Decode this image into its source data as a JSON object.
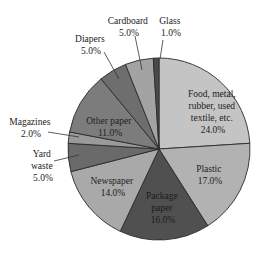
{
  "chart_data": {
    "type": "pie",
    "title": "",
    "start_angle_deg": 0,
    "direction": "clockwise",
    "slices": [
      {
        "label": "Food, metal, rubber, used textile, etc.",
        "value": 24.0,
        "display": "24.0%",
        "color": "#c4c4c4"
      },
      {
        "label": "Plastic",
        "value": 17.0,
        "display": "17.0%",
        "color": "#b2b2b2"
      },
      {
        "label": "Package paper",
        "value": 16.0,
        "display": "16.0%",
        "color": "#505050"
      },
      {
        "label": "Newspaper",
        "value": 14.0,
        "display": "14.0%",
        "color": "#a9a9a9"
      },
      {
        "label": "Yard waste",
        "value": 5.0,
        "display": "5.0%",
        "color": "#6a6a6a"
      },
      {
        "label": "Magazines",
        "value": 2.0,
        "display": "2.0%",
        "color": "#9a9a9a"
      },
      {
        "label": "Other paper",
        "value": 11.0,
        "display": "11.0%",
        "color": "#7c7c7c"
      },
      {
        "label": "Diapers",
        "value": 5.0,
        "display": "5.0%",
        "color": "#6e6e6e"
      },
      {
        "label": "Cardboard",
        "value": 5.0,
        "display": "5.0%",
        "color": "#a3a3a3"
      },
      {
        "label": "Glass",
        "value": 1.0,
        "display": "1.0%",
        "color": "#4a4a4a"
      }
    ]
  },
  "labels": {
    "food": {
      "lines": [
        "Food, metal,",
        "rubber, used",
        "textile, etc.",
        "24.0%"
      ]
    },
    "plastic": {
      "lines": [
        "Plastic",
        "17.0%"
      ]
    },
    "package": {
      "lines": [
        "Package",
        "paper",
        "16.0%"
      ]
    },
    "newspaper": {
      "lines": [
        "Newspaper",
        "14.0%"
      ]
    },
    "other": {
      "lines": [
        "Other paper",
        "11.0%"
      ]
    },
    "yard": {
      "lines": [
        "Yard",
        "waste",
        "5.0%"
      ]
    },
    "magazines": {
      "lines": [
        "Magazines",
        "2.0%"
      ]
    },
    "diapers": {
      "lines": [
        "Diapers",
        "5.0%"
      ]
    },
    "cardboard": {
      "lines": [
        "Cardboard",
        "5.0%"
      ]
    },
    "glass": {
      "lines": [
        "Glass",
        "1.0%"
      ]
    }
  }
}
